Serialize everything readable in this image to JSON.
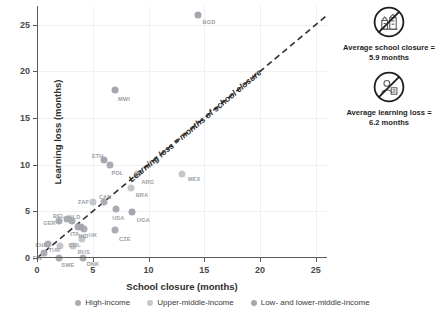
{
  "chart_data": {
    "type": "scatter",
    "title": "",
    "xlabel": "School closure (months)",
    "ylabel": "Learning loss (months)",
    "xlim": [
      0,
      26
    ],
    "ylim": [
      0,
      27
    ],
    "xticks": [
      0,
      5,
      10,
      15,
      20,
      25
    ],
    "yticks": [
      0,
      5,
      10,
      15,
      20,
      25
    ],
    "grid": true,
    "legend_position": "bottom",
    "reference_line": {
      "label": "Learning loss = months of school closure",
      "slope": 1,
      "intercept": 0,
      "style": "dashed"
    },
    "series": [
      {
        "name": "High-income",
        "color": "#a9adb3",
        "points": [
          {
            "label": "GER",
            "x": 2.0,
            "y": 4.0
          },
          {
            "label": "BEL",
            "x": 2.7,
            "y": 4.2
          },
          {
            "label": "NLD",
            "x": 3.1,
            "y": 4.0
          },
          {
            "label": "CAN",
            "x": 6.0,
            "y": 6.0
          },
          {
            "label": "UK",
            "x": 4.2,
            "y": 3.1
          },
          {
            "label": "ITA",
            "x": 3.7,
            "y": 3.3
          },
          {
            "label": "USA",
            "x": 7.1,
            "y": 5.2
          },
          {
            "label": "POL",
            "x": 6.5,
            "y": 10.0
          },
          {
            "label": "CZE",
            "x": 7.0,
            "y": 3.0
          },
          {
            "label": "CHE",
            "x": 1.0,
            "y": 1.5
          },
          {
            "label": "DNK",
            "x": 4.1,
            "y": 0.0
          },
          {
            "label": "FIN",
            "x": 0.6,
            "y": 0.5
          },
          {
            "label": "SWE",
            "x": 2.0,
            "y": 0.0
          }
        ]
      },
      {
        "name": "Upper-middle-income",
        "color": "#c4c7cb",
        "points": [
          {
            "label": "MEX",
            "x": 13.0,
            "y": 9.0
          },
          {
            "label": "BRA",
            "x": 8.4,
            "y": 7.5
          },
          {
            "label": "ARG",
            "x": 9.0,
            "y": 9.0
          },
          {
            "label": "ZAF",
            "x": 5.0,
            "y": 6.0
          },
          {
            "label": "RUS",
            "x": 3.2,
            "y": 1.3
          },
          {
            "label": "COL",
            "x": 4.0,
            "y": 2.0
          },
          {
            "label": "TUR",
            "x": 2.1,
            "y": 1.3
          }
        ]
      },
      {
        "name": "Low- and lower-middle-income",
        "color": "#a3a7ad",
        "points": [
          {
            "label": "BGD",
            "x": 14.4,
            "y": 26.0
          },
          {
            "label": "MWI",
            "x": 7.0,
            "y": 18.0
          },
          {
            "label": "ETH",
            "x": 6.0,
            "y": 10.5
          },
          {
            "label": "UGA",
            "x": 8.5,
            "y": 4.9
          },
          {
            "label": "IND",
            "x": 3.9,
            "y": 3.3
          }
        ]
      }
    ]
  },
  "axes": {
    "x_title": "School closure (months)",
    "y_title": "Learning loss (months)",
    "x_ticks": [
      "0",
      "5",
      "10",
      "15",
      "20",
      "25"
    ],
    "y_ticks": [
      "0",
      "5",
      "10",
      "15",
      "20",
      "25"
    ]
  },
  "reference_line_label": "Learning loss = months of school closure",
  "annotations": [
    {
      "icon": "no-school-icon",
      "line1": "Average school closure =",
      "line2": "5.9 months"
    },
    {
      "icon": "no-learning-icon",
      "line1": "Average learning loss =",
      "line2": "6.2 months"
    }
  ],
  "legend": {
    "items": [
      {
        "label": "High-income",
        "key": "high",
        "color": "#a9adb3"
      },
      {
        "label": "Upper-middle-income",
        "key": "upper",
        "color": "#c4c7cb"
      },
      {
        "label": "Low- and lower-middle-income",
        "key": "low",
        "color": "#a3a7ad"
      }
    ]
  }
}
